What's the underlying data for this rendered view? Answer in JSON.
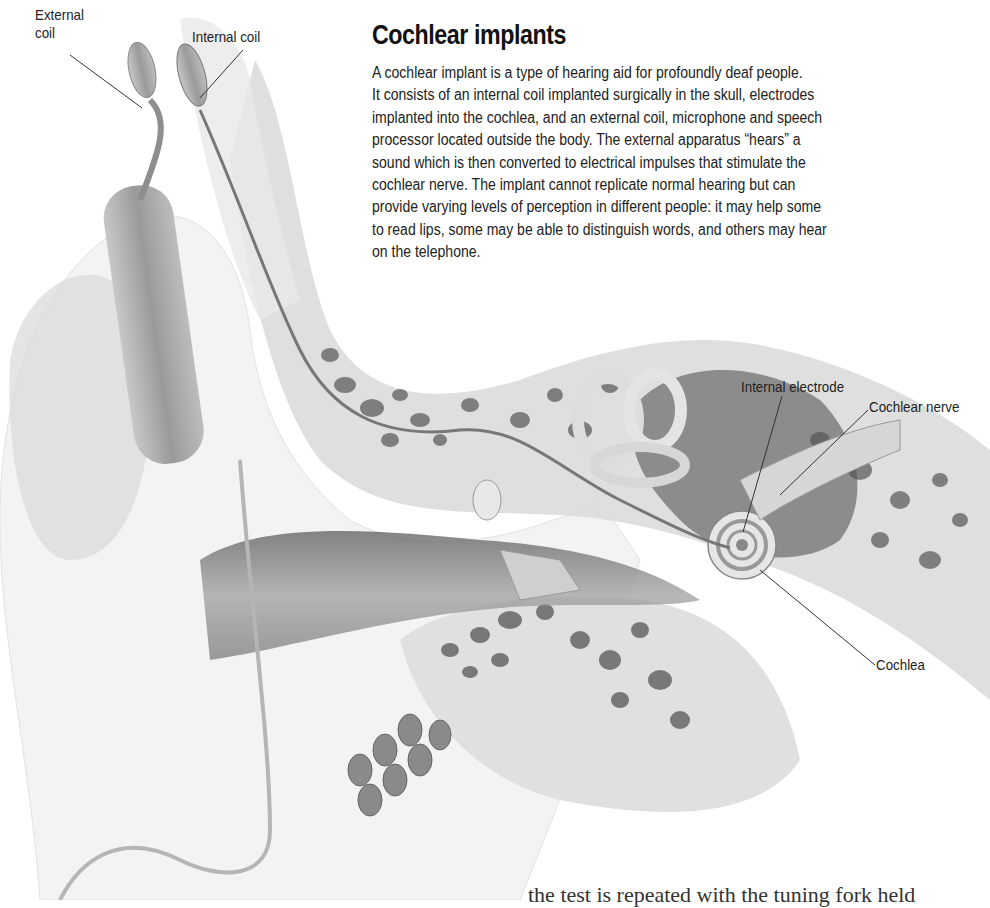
{
  "page": {
    "title": "Cochlear implants",
    "body_lines": [
      "A cochlear implant is a type of hearing aid for profoundly deaf people.",
      "It consists of an internal coil implanted surgically in the skull, electrodes",
      "implanted into the cochlea, and an external coil, microphone and speech",
      "processor located outside the body. The external apparatus “hears” a",
      "sound which is then converted to electrical impulses that stimulate the",
      "cochlear nerve. The implant cannot replicate normal hearing but can",
      "provide varying levels of perception in different people: it may help some",
      "to read lips, some may be able to distinguish words, and others may hear",
      "on the telephone."
    ],
    "footer_partial_text": "the test is repeated with the tuning fork held"
  },
  "diagram": {
    "labels": [
      {
        "id": "external-coil",
        "lines": [
          "External",
          "coil"
        ]
      },
      {
        "id": "internal-coil",
        "text": "Internal coil"
      },
      {
        "id": "internal-electrode",
        "text": "Internal electrode"
      },
      {
        "id": "cochlear-nerve",
        "text": "Cochlear nerve"
      },
      {
        "id": "cochlea",
        "text": "Cochlea"
      }
    ],
    "colors": {
      "bone": "#d9d9d9",
      "bone_pores": "#6e6e6e",
      "soft_tissue": "#efefef",
      "canal_shadow": "#8a8a8a",
      "leader_line": "#333333"
    }
  }
}
